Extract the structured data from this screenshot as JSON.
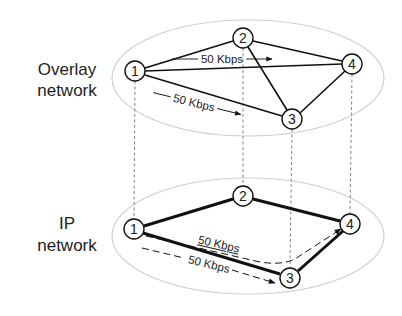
{
  "diagram": {
    "layers": [
      {
        "id": "overlay",
        "label_line1": "Overlay",
        "label_line2": "network",
        "ellipse": {
          "cx": 248,
          "cy": 78,
          "rx": 136,
          "ry": 58,
          "stroke": "#cfcfcf"
        },
        "nodes": [
          {
            "id": "1",
            "label": "1",
            "x": 135,
            "y": 71
          },
          {
            "id": "2",
            "label": "2",
            "x": 243,
            "y": 38
          },
          {
            "id": "3",
            "label": "3",
            "x": 292,
            "y": 119
          },
          {
            "id": "4",
            "label": "4",
            "x": 352,
            "y": 64
          }
        ],
        "links": [
          [
            "1",
            "2"
          ],
          [
            "1",
            "4"
          ],
          [
            "1",
            "3"
          ],
          [
            "2",
            "4"
          ],
          [
            "2",
            "3"
          ],
          [
            "3",
            "4"
          ]
        ],
        "flows": [
          {
            "label": "50 Kbps",
            "style": "solid"
          },
          {
            "label": "50 Kbps",
            "style": "solid"
          }
        ]
      },
      {
        "id": "ip",
        "label_line1": "IP",
        "label_line2": "network",
        "ellipse": {
          "cx": 248,
          "cy": 236,
          "rx": 136,
          "ry": 58,
          "stroke": "#cfcfcf"
        },
        "nodes": [
          {
            "id": "1",
            "label": "1",
            "x": 134,
            "y": 229
          },
          {
            "id": "2",
            "label": "2",
            "x": 243,
            "y": 196
          },
          {
            "id": "3",
            "label": "3",
            "x": 290,
            "y": 278
          },
          {
            "id": "4",
            "label": "4",
            "x": 350,
            "y": 224
          }
        ],
        "links": [
          [
            "1",
            "2"
          ],
          [
            "2",
            "4"
          ],
          [
            "1",
            "3"
          ],
          [
            "3",
            "4"
          ]
        ],
        "flows": [
          {
            "label": "50 Kbps",
            "style": "dashed",
            "path": "1-3-4"
          },
          {
            "label": "50 Kbps",
            "style": "dashed",
            "path": "1-3"
          }
        ]
      }
    ],
    "colors": {
      "line": "#111111",
      "ellipse": "#cfcfcf",
      "projection": "#777777"
    }
  }
}
